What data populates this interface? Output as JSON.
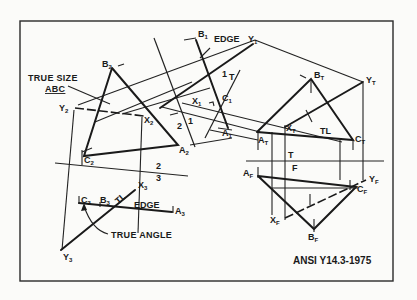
{
  "figure": {
    "standard_label": "ANSI Y14.3-1975",
    "annotations": {
      "true_size_line1": "TRUE SIZE",
      "true_size_line2": "ABC",
      "edge_view_1": "EDGE",
      "edge_view_3": "EDGE",
      "true_angle": "TRUE ANGLE",
      "true_length_top": "TL",
      "true_length_view3": "TL"
    },
    "fold_lines": [
      {
        "id": "T-F",
        "upper": "T",
        "lower": "F"
      },
      {
        "id": "1-T",
        "left": "1",
        "right": "T"
      },
      {
        "id": "2-1",
        "left": "2",
        "right": "1"
      },
      {
        "id": "2-3",
        "upper": "2",
        "lower": "3"
      }
    ],
    "point_labels": {
      "view_top": [
        "A",
        "B",
        "C",
        "X",
        "Y"
      ],
      "view_front": [
        "A",
        "B",
        "C",
        "X",
        "Y"
      ],
      "view_1": [
        "A",
        "B",
        "C",
        "X",
        "Y"
      ],
      "view_2": [
        "A",
        "B",
        "C",
        "X",
        "Y"
      ],
      "view_3": [
        "A",
        "B",
        "C",
        "X",
        "Y"
      ]
    },
    "subscripts": {
      "top": "T",
      "front": "F",
      "aux1": "1",
      "aux2": "2",
      "aux3": "3"
    }
  }
}
